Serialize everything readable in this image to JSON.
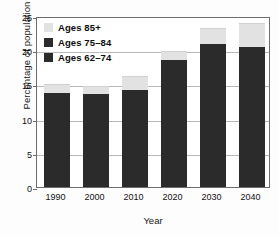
{
  "chart_data": {
    "type": "bar",
    "stacked": true,
    "title": "",
    "xlabel": "Year",
    "ylabel": "Percentage of population",
    "categories": [
      "1990",
      "2000",
      "2010",
      "2020",
      "2030",
      "2040"
    ],
    "series": [
      {
        "name": "Ages 62–74",
        "color": "#2b2b2b",
        "values": [
          13.7,
          13.6,
          14.2,
          18.6,
          20.9,
          20.4
        ]
      },
      {
        "name": "Ages 75–84",
        "color": "#2b2b2b",
        "values": [
          0,
          0,
          0,
          0,
          0,
          0
        ]
      },
      {
        "name": "Ages 85+",
        "color": "#e2e2e2",
        "values": [
          1.3,
          1.2,
          2.0,
          1.3,
          2.3,
          3.6
        ]
      }
    ],
    "totals": [
      15.0,
      14.8,
      16.2,
      19.9,
      23.2,
      24.0
    ],
    "ylim": [
      0,
      25
    ],
    "yticks": [
      "0",
      "5",
      "10",
      "15",
      "20",
      "25"
    ],
    "ytick_values": [
      0,
      5,
      10,
      15,
      20,
      25
    ],
    "grid": true,
    "legend_position": "top-left",
    "legend": [
      "Ages 85+",
      "Ages 75–84",
      "Ages 62–74"
    ]
  },
  "legend": {
    "items": [
      {
        "label": "Ages 85+",
        "swatch": "sw-light"
      },
      {
        "label": "Ages 75–84",
        "swatch": "sw-dark"
      },
      {
        "label": "Ages 62–74",
        "swatch": "sw-dark"
      }
    ]
  },
  "axes": {
    "x_title": "Year",
    "y_title": "Percentage of population"
  }
}
